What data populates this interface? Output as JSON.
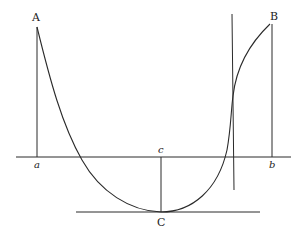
{
  "diagram": {
    "type": "geometric-curve-diagram",
    "labels": {
      "A": "A",
      "B": "B",
      "C": "C",
      "a": "a",
      "b": "b",
      "c": "c"
    },
    "colors": {
      "stroke": "#2a2a2a",
      "background": "#ffffff",
      "text": "#222222"
    },
    "elements": [
      {
        "id": "baseline",
        "kind": "horizontal-line",
        "from": "left",
        "to": "right"
      },
      {
        "id": "ordinate-Aa",
        "kind": "vertical-segment",
        "from": "A",
        "to": "a"
      },
      {
        "id": "ordinate-Bb",
        "kind": "vertical-segment",
        "from": "B",
        "to": "b"
      },
      {
        "id": "ordinate-cC",
        "kind": "vertical-segment",
        "from": "c",
        "to": "C"
      },
      {
        "id": "tangent-at-C",
        "kind": "horizontal-line",
        "through": "C"
      },
      {
        "id": "vertical-asymptote-line",
        "kind": "vertical-line",
        "near": "B"
      },
      {
        "id": "curve-ACB",
        "kind": "curve",
        "through": [
          "A",
          "C",
          "B"
        ]
      }
    ]
  }
}
